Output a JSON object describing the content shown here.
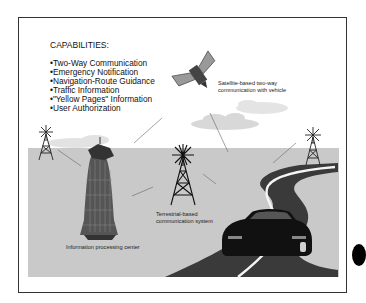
{
  "page": {
    "top_caption_partial": "(Cut-off caption text)"
  },
  "capabilities": {
    "title": "CAPABILITIES:",
    "items": [
      "Two-Way Communication",
      "Emergency Notification",
      "Navigation-Route Guidance",
      "Traffic Information",
      "\"Yellow Pages\" Information",
      "User Authorization"
    ]
  },
  "labels": {
    "satellite": [
      "Satellite-based two-way",
      "communication with vehicle"
    ],
    "terrestrial": [
      "Terrestrial-based",
      "communication system"
    ],
    "processing_center": "Information processing center"
  },
  "icons": {
    "satellite": "satellite-icon",
    "towers": [
      "left-tower-icon",
      "center-tower-icon",
      "right-tower-icon"
    ],
    "building": "processing-center-building-icon",
    "car": "car-icon",
    "road": "road-illustration",
    "clouds": [
      "cloud-left",
      "cloud-center",
      "cloud-right"
    ]
  },
  "colors": {
    "ground": "#c9c9c9",
    "road": "#3a3a3a",
    "cloud": "#dcdcdc",
    "frame": "#333333"
  }
}
